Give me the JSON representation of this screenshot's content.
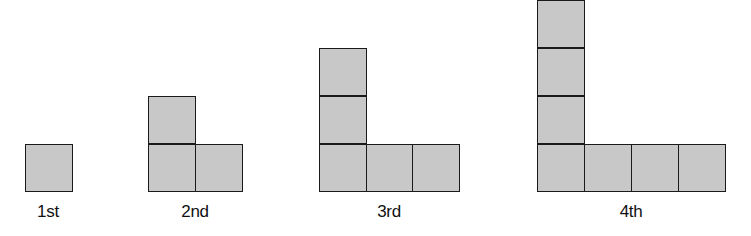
{
  "figure": {
    "colors": {
      "square_fill": "#c8c8c8",
      "square_border": "#1a1a1a",
      "background": "#ffffff"
    },
    "stages": [
      {
        "label": "1st",
        "squares": 1
      },
      {
        "label": "2nd",
        "squares": 3
      },
      {
        "label": "3rd",
        "squares": 5
      },
      {
        "label": "4th",
        "squares": 7
      }
    ]
  }
}
